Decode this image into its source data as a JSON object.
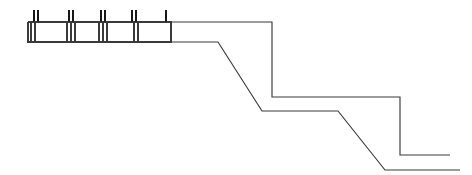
{
  "drawing": {
    "title": "Stepped profile line drawing",
    "description": "Technical line diagram of a stepped terrain or wall profile with a segmented bar at upper left",
    "canvas": {
      "width": 472,
      "height": 175,
      "background": "#ffffff"
    },
    "colors": {
      "line": "#3a3a3a",
      "tick": "#171717",
      "background": "#ffffff",
      "fill": "#ffffff"
    },
    "stroke_width": 1.15,
    "upper_profile": {
      "name": "upper-profile-polyline",
      "points": "28,22 272,22 272,97 357,97 400,97 400,155 450,155",
      "vertices": [
        {
          "x": 28,
          "y": 22
        },
        {
          "x": 272,
          "y": 22
        },
        {
          "x": 272,
          "y": 97
        },
        {
          "x": 400,
          "y": 97
        },
        {
          "x": 400,
          "y": 155
        },
        {
          "x": 450,
          "y": 155
        }
      ]
    },
    "lower_profile": {
      "name": "lower-profile-polyline",
      "points": "28,42 218,42 262,111 338,111 385,170 460,170",
      "vertices": [
        {
          "x": 28,
          "y": 42
        },
        {
          "x": 218,
          "y": 42
        },
        {
          "x": 262,
          "y": 111
        },
        {
          "x": 338,
          "y": 111
        },
        {
          "x": 385,
          "y": 170
        },
        {
          "x": 460,
          "y": 170
        }
      ]
    },
    "segmented_bar": {
      "name": "segmented-bar",
      "left": 28,
      "right": 171,
      "top": 22,
      "bottom": 42,
      "outline": "28,22 171,22 171,42 28,42 28,22",
      "dividers": [
        {
          "x": 31
        },
        {
          "x": 35
        },
        {
          "x": 67
        },
        {
          "x": 71
        },
        {
          "x": 75
        },
        {
          "x": 99
        },
        {
          "x": 103
        },
        {
          "x": 107
        },
        {
          "x": 134
        },
        {
          "x": 138
        },
        {
          "x": 171
        }
      ]
    },
    "ticks": {
      "name": "tick-marks",
      "top_y": 10,
      "bottom_y": 22,
      "marks": [
        {
          "x": 34
        },
        {
          "x": 38
        },
        {
          "x": 69
        },
        {
          "x": 73
        },
        {
          "x": 101
        },
        {
          "x": 105
        },
        {
          "x": 132
        },
        {
          "x": 136
        },
        {
          "x": 166
        }
      ]
    }
  }
}
